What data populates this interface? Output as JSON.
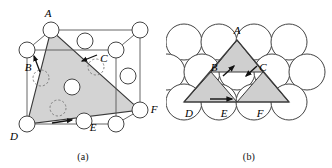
{
  "figure": {
    "panels": [
      {
        "id": "a",
        "caption": "(a)",
        "description": "FCC unit cell with shaded (111) plane triangle A-D-F",
        "vertex_labels": [
          "A",
          "B",
          "C",
          "D",
          "E",
          "F"
        ],
        "labels": {
          "A": "A",
          "B": "B",
          "C": "C",
          "D": "D",
          "E": "E",
          "F": "F"
        },
        "shade_color": "#d3d3d3",
        "line_color": "#3a3a3a",
        "atom_fill": "#ffffff"
      },
      {
        "id": "b",
        "caption": "(b)",
        "description": "Close-packed plane of atoms showing triangle A-D-F",
        "vertex_labels": [
          "A",
          "B",
          "C",
          "D",
          "E",
          "F"
        ],
        "labels": {
          "A": "A",
          "B": "B",
          "C": "C",
          "D": "D",
          "E": "E",
          "F": "F"
        },
        "rows": [
          4,
          5,
          4
        ],
        "shade_color": "#cfcfcf",
        "line_color": "#3a3a3a",
        "atom_fill": "#ffffff"
      }
    ]
  }
}
